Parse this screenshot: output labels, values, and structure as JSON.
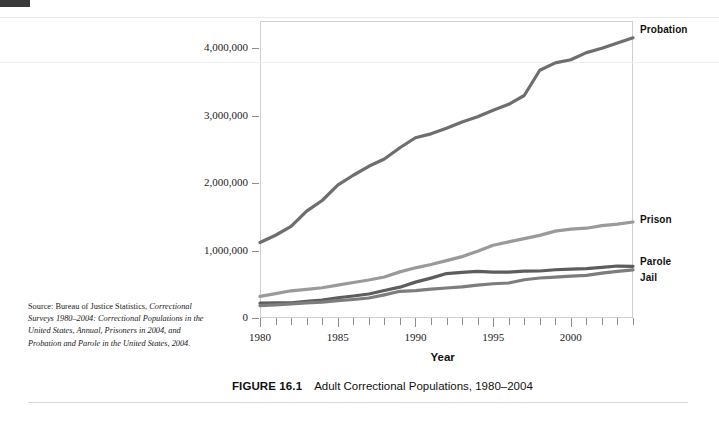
{
  "figure": {
    "number_label": "FIGURE 16.1",
    "caption": "Adult Correctional Populations, 1980–2004"
  },
  "source_note": {
    "lead": "Source: Bureau of Justice Statistics,",
    "line2": "Correctional Surveys 1980–2004:",
    "line3": "Correctional Populations in the United",
    "line4a": "States, Annual, ",
    "line4b": "Prisoners in 2004",
    "line4c": ", and",
    "line5": "Probation and Parole in the United States,",
    "line6": "2004."
  },
  "chart_data": {
    "type": "line",
    "title": "Adult Correctional Populations, 1980–2004",
    "xlabel": "Year",
    "ylabel": "",
    "xlim": [
      1980,
      2004
    ],
    "ylim": [
      0,
      4400000
    ],
    "xticks": [
      1980,
      1985,
      1990,
      1995,
      2000
    ],
    "xtick_labels": [
      "1980",
      "1985",
      "1990",
      "1995",
      "2000"
    ],
    "xtick_minor_every": 1,
    "yticks": [
      0,
      1000000,
      2000000,
      3000000,
      4000000
    ],
    "ytick_labels": [
      "0",
      "1,000,000",
      "2,000,000",
      "3,000,000",
      "4,000,000"
    ],
    "grid": false,
    "legend_position": "right-inline-labels",
    "x": [
      1980,
      1981,
      1982,
      1983,
      1984,
      1985,
      1986,
      1987,
      1988,
      1989,
      1990,
      1991,
      1992,
      1993,
      1994,
      1995,
      1996,
      1997,
      1998,
      1999,
      2000,
      2001,
      2002,
      2003,
      2004
    ],
    "series": [
      {
        "name": "Probation",
        "color": "#6e6e6e",
        "label": "Probation",
        "values": [
          1118097,
          1225934,
          1357264,
          1582947,
          1740948,
          1968712,
          2114621,
          2247158,
          2356483,
          2522125,
          2670234,
          2728472,
          2811611,
          2903061,
          2981022,
          3077861,
          3164996,
          3296513,
          3670441,
          3779922,
          3826209,
          3931731,
          3995165,
          4073987,
          4151125
        ]
      },
      {
        "name": "Prison",
        "color": "#9a9a9a",
        "label": "Prison",
        "values": [
          319598,
          360029,
          402914,
          423898,
          448264,
          487593,
          526436,
          562814,
          607766,
          683367,
          743382,
          792535,
          850566,
          909381,
          990147,
          1078542,
          1127528,
          1176564,
          1224469,
          1287172,
          1316333,
          1330007,
          1367547,
          1390279,
          1421911
        ]
      },
      {
        "name": "Parole",
        "color": "#5d5d5d",
        "label": "Parole",
        "values": [
          220438,
          225539,
          224604,
          246440,
          266992,
          300203,
          325638,
          355505,
          407977,
          456803,
          531407,
          590442,
          658601,
          676100,
          690371,
          679421,
          679733,
          694787,
          696385,
          714457,
          723898,
          732333,
          750934,
          769925,
          765355
        ]
      },
      {
        "name": "Jail",
        "color": "#7d7d7d",
        "label": "Jail",
        "values": [
          182288,
          195085,
          209582,
          223551,
          234500,
          256615,
          274444,
          295873,
          343569,
          395553,
          405320,
          426479,
          444584,
          459804,
          486474,
          507044,
          518492,
          567079,
          592462,
          605943,
          621149,
          631240,
          665475,
          691301,
          713990
        ]
      }
    ]
  }
}
